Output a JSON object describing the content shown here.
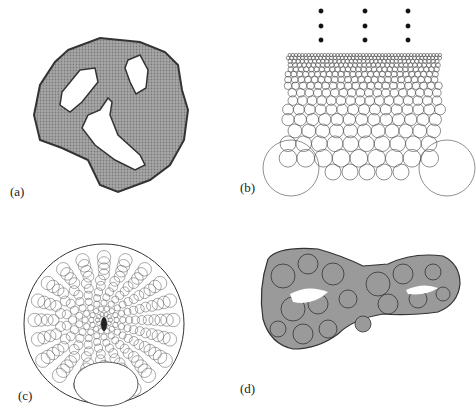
{
  "figure": {
    "panels": [
      {
        "id": "a",
        "label": "(a)",
        "description": "Hex-packed circles filling an irregular region with three holes"
      },
      {
        "id": "b",
        "label": "(b)",
        "description": "Graded circle packing in a rectangle with two large bottom corner circles and dots above"
      },
      {
        "id": "c",
        "label": "(c)",
        "description": "Circle packing of a disk with refinement toward a center point"
      },
      {
        "id": "d",
        "label": "(d)",
        "description": "Gray packed blobs filling a two-holed domain"
      }
    ],
    "colors": {
      "fill_gray": "#9a9a9a",
      "stroke": "#333333",
      "background": "#ffffff"
    }
  }
}
